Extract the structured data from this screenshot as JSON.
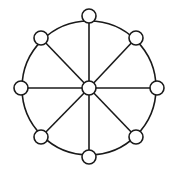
{
  "diagram": {
    "type": "wheel-graph",
    "width": 175,
    "height": 175,
    "background": "#ffffff",
    "stroke_color": "#1a1a1a",
    "node_fill": "#ffffff",
    "stroke_width": 1.6,
    "ring": {
      "cx": 89,
      "cy": 88,
      "r": 67
    },
    "node_radius": 7,
    "hub": {
      "id": "center",
      "cx": 89,
      "cy": 88
    },
    "nodes": [
      {
        "id": "top",
        "cx": 89,
        "cy": 16
      },
      {
        "id": "upper-right",
        "cx": 136,
        "cy": 38
      },
      {
        "id": "right",
        "cx": 157,
        "cy": 88
      },
      {
        "id": "lower-right",
        "cx": 136,
        "cy": 137
      },
      {
        "id": "bottom",
        "cx": 89,
        "cy": 157
      },
      {
        "id": "lower-left",
        "cx": 41,
        "cy": 137
      },
      {
        "id": "left",
        "cx": 21,
        "cy": 88
      },
      {
        "id": "upper-left",
        "cx": 41,
        "cy": 38
      }
    ],
    "spokes": [
      {
        "from": "center",
        "to": "top"
      },
      {
        "from": "center",
        "to": "upper-right"
      },
      {
        "from": "center",
        "to": "right"
      },
      {
        "from": "center",
        "to": "lower-right"
      },
      {
        "from": "center",
        "to": "bottom"
      },
      {
        "from": "center",
        "to": "lower-left"
      },
      {
        "from": "center",
        "to": "left"
      },
      {
        "from": "center",
        "to": "upper-left"
      }
    ]
  }
}
